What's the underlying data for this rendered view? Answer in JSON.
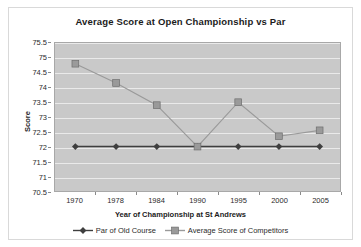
{
  "chart_data": {
    "type": "line",
    "title": "Average Score at Open Championship vs Par",
    "xlabel": "Year of Championship at St Andrews",
    "ylabel": "Score",
    "categories": [
      "1970",
      "1978",
      "1984",
      "1990",
      "1995",
      "2000",
      "2005"
    ],
    "ylim": [
      70.5,
      75.5
    ],
    "yticks": [
      "70.5",
      "71",
      "71.5",
      "72",
      "72.5",
      "73",
      "73.5",
      "74",
      "74.5",
      "75",
      "75.5"
    ],
    "grid": true,
    "legend_position": "bottom",
    "series": [
      {
        "name": "Par of Old Course",
        "marker": "diamond",
        "color": "#3f3f3f",
        "values": [
          72,
          72,
          72,
          72,
          72,
          72,
          72
        ]
      },
      {
        "name": "Average Score of Competitors",
        "marker": "square",
        "color": "#9a9a9a",
        "values": [
          74.8,
          74.15,
          73.4,
          72.0,
          73.5,
          72.35,
          72.55
        ]
      }
    ]
  },
  "style": {
    "plot_background": "#c9c9c9",
    "gridline_color": "#eaeaea",
    "frame_border": "#d9d9d9",
    "text_color": "#1b1b1b"
  }
}
